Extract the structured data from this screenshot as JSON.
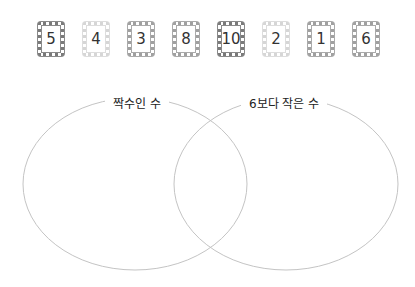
{
  "cards": [
    {
      "value": "5",
      "style": "dark"
    },
    {
      "value": "4",
      "style": "light"
    },
    {
      "value": "3",
      "style": "mid"
    },
    {
      "value": "8",
      "style": "mid"
    },
    {
      "value": "10",
      "style": "dark"
    },
    {
      "value": "2",
      "style": "light"
    },
    {
      "value": "1",
      "style": "mid"
    },
    {
      "value": "6",
      "style": "mid"
    }
  ],
  "venn": {
    "left_label": "짝수인 수",
    "right_label": "6보다 작은 수",
    "stroke_color": "#c4c4c4"
  }
}
